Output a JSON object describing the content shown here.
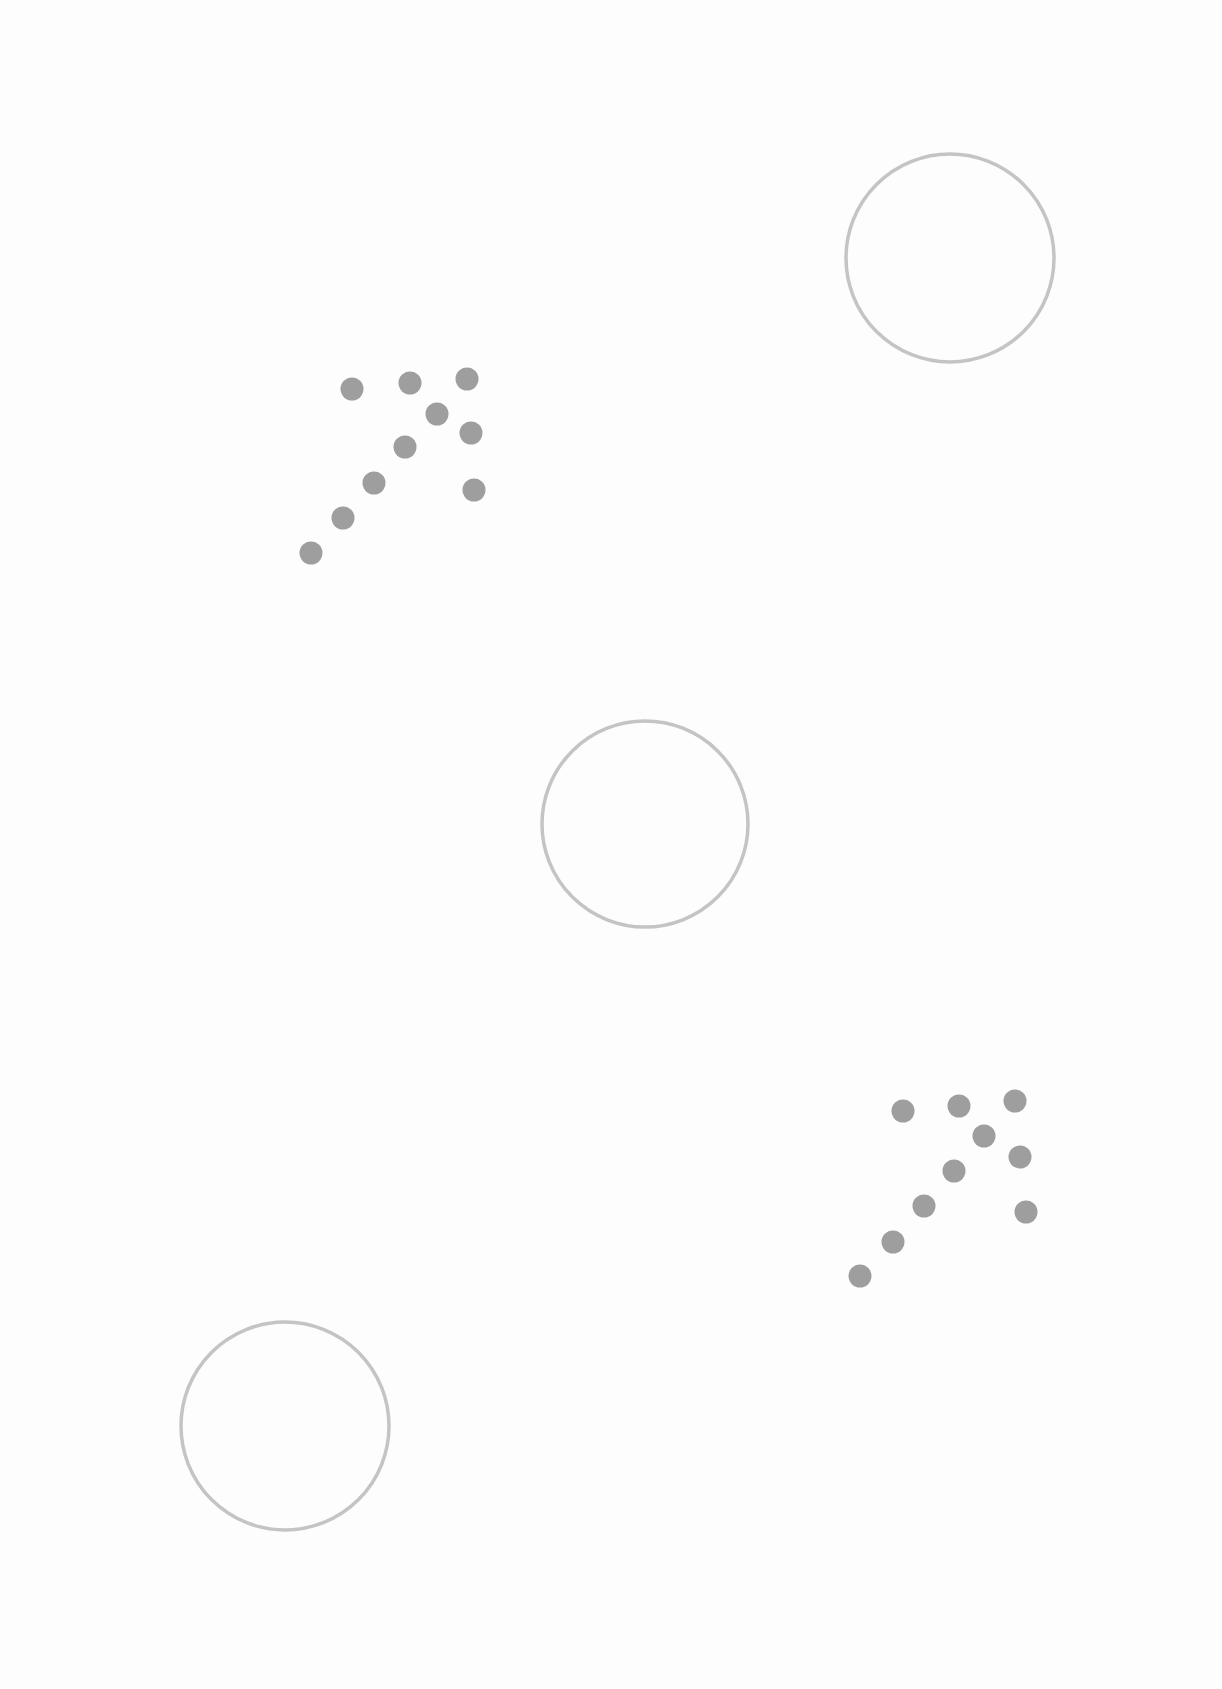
{
  "page": {
    "background": "#fdfdfd",
    "width": 1222,
    "height": 1689
  },
  "style": {
    "circle_stroke": "#c4c4c4",
    "dot_fill": "#9e9e9e"
  },
  "circles": [
    {
      "cx": 950,
      "cy": 258,
      "r": 104
    },
    {
      "cx": 645,
      "cy": 824,
      "r": 103
    },
    {
      "cx": 285,
      "cy": 1426,
      "r": 104
    }
  ],
  "dot_clusters": [
    {
      "dots": [
        [
          352,
          389
        ],
        [
          410,
          383
        ],
        [
          467,
          379
        ],
        [
          437,
          414
        ],
        [
          471,
          433
        ],
        [
          405,
          447
        ],
        [
          374,
          483
        ],
        [
          343,
          518
        ],
        [
          311,
          553
        ],
        [
          474,
          490
        ]
      ]
    },
    {
      "dots": [
        [
          903,
          1111
        ],
        [
          959,
          1106
        ],
        [
          1015,
          1101
        ],
        [
          984,
          1136
        ],
        [
          1020,
          1157
        ],
        [
          954,
          1171
        ],
        [
          924,
          1206
        ],
        [
          893,
          1242
        ],
        [
          860,
          1276
        ],
        [
          1026,
          1212
        ]
      ]
    }
  ]
}
